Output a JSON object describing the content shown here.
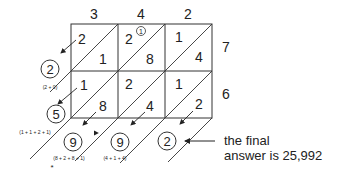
{
  "multiplicand_digits": [
    "3",
    "4",
    "2"
  ],
  "multiplier_digits": [
    "7",
    "6"
  ],
  "grid": {
    "rows": [
      [
        {
          "tens": "2",
          "ones": "1"
        },
        {
          "tens": "2",
          "ones": "8",
          "carry": "1"
        },
        {
          "tens": "1",
          "ones": "4"
        }
      ],
      [
        {
          "tens": "1",
          "ones": "8"
        },
        {
          "tens": "2",
          "ones": "4"
        },
        {
          "tens": "1",
          "ones": "2"
        }
      ]
    ]
  },
  "diagonal_sums": [
    {
      "result": "2",
      "expression": "(2 + 0)"
    },
    {
      "result": "5",
      "expression": "(1 + 1 + 2 + 1)"
    },
    {
      "result": "9",
      "expression": "(8 + 2 + 8 + 1)",
      "marker": "*"
    },
    {
      "result": "9",
      "expression": "(4 + 1 + 4)"
    },
    {
      "result": "2",
      "expression": ""
    }
  ],
  "annotation": {
    "line1": "the final",
    "line2": "answer is 25,992"
  }
}
